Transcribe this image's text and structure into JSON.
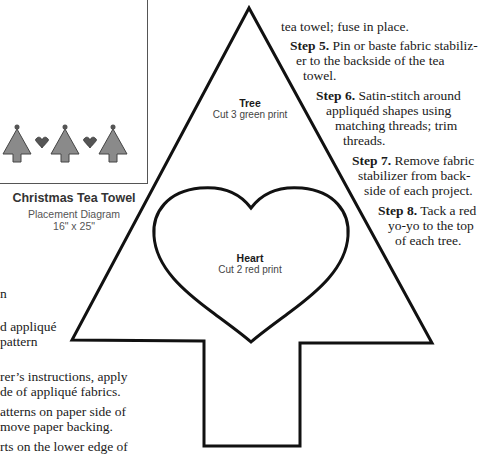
{
  "placement_diagram": {
    "title": "Christmas Tea Towel",
    "subtitle": "Placement Diagram",
    "dimensions": "16\" x 25\"",
    "motifs": [
      "tree",
      "heart",
      "tree",
      "heart",
      "tree"
    ],
    "colors": {
      "tree": "#8a8a8a",
      "heart": "#555555",
      "outline": "#444444"
    }
  },
  "patterns": {
    "tree": {
      "title": "Tree",
      "instruction": "Cut 3 green print"
    },
    "heart": {
      "title": "Heart",
      "instruction": "Cut 2 red print"
    }
  },
  "left_text": {
    "lines": [
      "n",
      "d appliqué",
      " pattern",
      "rer’s instructions, apply",
      "de of appliqué fabrics.",
      "atterns on paper side of",
      "move paper backing.",
      "rts on the lower edge of"
    ]
  },
  "right_text": {
    "lines": [
      {
        "step": "",
        "text": "tea towel; fuse in place."
      },
      {
        "step": "Step 5.",
        "text": " Pin or baste fabric stabiliz-"
      },
      {
        "step": "",
        "text": "er to the backside of the tea"
      },
      {
        "step": "",
        "text": "towel."
      },
      {
        "step": "Step 6.",
        "text": " Satin-stitch around"
      },
      {
        "step": "",
        "text": "appliquéd shapes using"
      },
      {
        "step": "",
        "text": "matching threads; trim"
      },
      {
        "step": "",
        "text": "threads."
      },
      {
        "step": "Step 7.",
        "text": " Remove fabric"
      },
      {
        "step": "",
        "text": "stabilizer from back-"
      },
      {
        "step": "",
        "text": "side of each project."
      },
      {
        "step": "Step 8.",
        "text": " Tack a red"
      },
      {
        "step": "",
        "text": "yo-yo to the top"
      },
      {
        "step": "",
        "text": "of each tree."
      }
    ]
  }
}
